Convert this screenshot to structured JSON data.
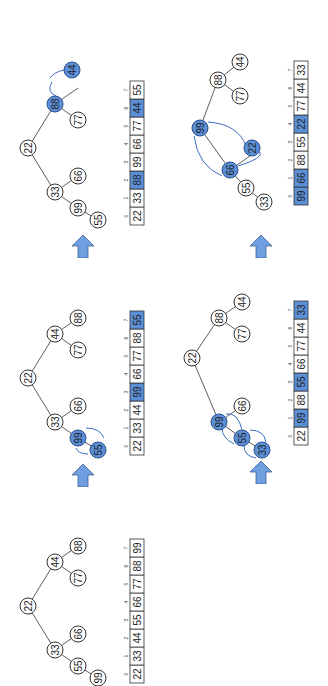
{
  "figure": {
    "orientation": "rotated -90deg (content reads bottom-to-top)",
    "highlight_color": "#5b8fd8",
    "arrow_color": "#6f9fe0",
    "edge_color": "#333333",
    "indices": [
      "0",
      "1",
      "2",
      "3",
      "4",
      "5",
      "6",
      "7"
    ]
  },
  "steps": [
    {
      "name": "step-1",
      "array": [
        "22",
        "33",
        "44",
        "55",
        "66",
        "77",
        "88",
        "99"
      ],
      "highlighted_cells": [],
      "nodes": {
        "n0": "22",
        "n1": "33",
        "n2": "44",
        "n3": "55",
        "n4": "66",
        "n5": "77",
        "n6": "88",
        "n7": "99"
      },
      "highlighted_nodes": [],
      "swaps": []
    },
    {
      "name": "step-2",
      "array": [
        "22",
        "33",
        "44",
        "99",
        "66",
        "77",
        "88",
        "55"
      ],
      "highlighted_cells": [
        3,
        7
      ],
      "nodes": {
        "n0": "22",
        "n1": "33",
        "n2": "44",
        "n3": "99",
        "n4": "66",
        "n5": "77",
        "n6": "88",
        "n7": "55"
      },
      "highlighted_nodes": [
        "n3",
        "n7"
      ],
      "swaps": [
        [
          "n3",
          "n7"
        ]
      ]
    },
    {
      "name": "step-3",
      "array": [
        "22",
        "33",
        "88",
        "99",
        "66",
        "77",
        "44",
        "55"
      ],
      "highlighted_cells": [
        2,
        6
      ],
      "nodes": {
        "n0": "22",
        "n1": "33",
        "n2": "88",
        "n3": "99",
        "n4": "66",
        "n5": "77",
        "n6": "44",
        "n7": "55"
      },
      "highlighted_nodes": [
        "n2",
        "n6"
      ],
      "swaps": [
        [
          "n2",
          "n6"
        ]
      ]
    },
    {
      "name": "step-4",
      "array": [
        "22",
        "99",
        "88",
        "55",
        "66",
        "77",
        "44",
        "33"
      ],
      "highlighted_cells": [
        1,
        3,
        7
      ],
      "nodes": {
        "n0": "22",
        "n1": "99",
        "n2": "88",
        "n3": "55",
        "n4": "66",
        "n5": "77",
        "n6": "44",
        "n7": "33"
      },
      "highlighted_nodes": [
        "n1",
        "n3",
        "n7"
      ],
      "swaps": [
        [
          "n1",
          "n3"
        ],
        [
          "n3",
          "n7"
        ]
      ]
    },
    {
      "name": "step-5",
      "array": [
        "99",
        "66",
        "88",
        "55",
        "22",
        "77",
        "44",
        "33"
      ],
      "highlighted_cells": [
        0,
        1,
        4
      ],
      "nodes": {
        "n0": "99",
        "n1": "66",
        "n2": "88",
        "n3": "55",
        "n4": "22",
        "n5": "77",
        "n6": "44",
        "n7": "33"
      },
      "highlighted_nodes": [
        "n0",
        "n1",
        "n4"
      ],
      "swaps": [
        [
          "n0",
          "n1"
        ],
        [
          "n1",
          "n4"
        ]
      ]
    }
  ]
}
